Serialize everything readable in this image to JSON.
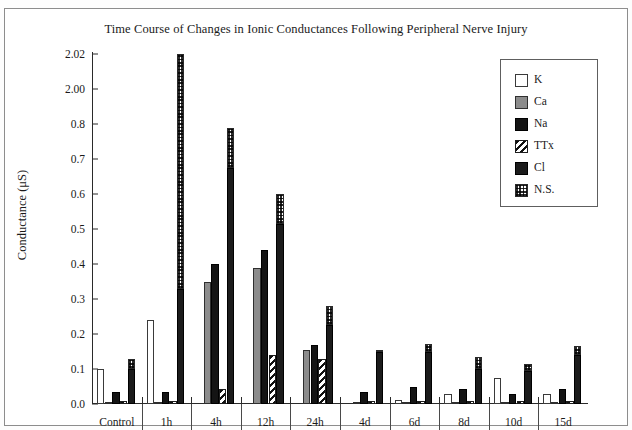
{
  "chart_data": {
    "type": "bar",
    "title": "Time Course of Changes in Ionic Conductances Following Peripheral Nerve Injury",
    "xlabel": "",
    "ylabel": "Conductance (μS)",
    "grid": false,
    "legend_position": "top-right",
    "broken_axis": true,
    "y_ticks": [
      {
        "label": "0.0",
        "value": 0.0
      },
      {
        "label": "0.1",
        "value": 0.1
      },
      {
        "label": "0.2",
        "value": 0.2
      },
      {
        "label": "0.3",
        "value": 0.3
      },
      {
        "label": "0.4",
        "value": 0.4
      },
      {
        "label": "0.5",
        "value": 0.5
      },
      {
        "label": "0.6",
        "value": 0.6
      },
      {
        "label": "0.7",
        "value": 0.7
      },
      {
        "label": "0.8",
        "value": 0.8
      },
      {
        "label": "2.00",
        "value": 2.0
      },
      {
        "label": "2.02",
        "value": 2.02
      }
    ],
    "ylim": [
      0.0,
      2.02
    ],
    "categories": [
      "Control",
      "1h",
      "4h",
      "12h",
      "24h",
      "4d",
      "6d",
      "8d",
      "10d",
      "15d"
    ],
    "series": [
      {
        "name": "K",
        "values": [
          0.1,
          0.24,
          0.0,
          0.0,
          0.0,
          0.0,
          0.012,
          0.03,
          0.075,
          0.03
        ]
      },
      {
        "name": "Ca",
        "values": [
          0.006,
          0.004,
          0.35,
          0.39,
          0.155,
          0.006,
          0.006,
          0.005,
          0.004,
          0.004
        ]
      },
      {
        "name": "Na",
        "values": [
          0.035,
          0.035,
          0.4,
          0.44,
          0.17,
          0.035,
          0.05,
          0.042,
          0.03,
          0.042
        ]
      },
      {
        "name": "TTx",
        "values": [
          0.01,
          0.008,
          0.042,
          0.14,
          0.13,
          0.008,
          0.01,
          0.008,
          0.01,
          0.01
        ]
      },
      {
        "name": "Cl",
        "values": [
          0.1,
          0.33,
          0.675,
          0.515,
          0.225,
          0.148,
          0.148,
          0.1,
          0.095,
          0.14
        ]
      },
      {
        "name": "N.S.",
        "values": [
          0.13,
          2.02,
          0.79,
          0.6,
          0.28,
          0.155,
          0.172,
          0.133,
          0.113,
          0.165
        ]
      }
    ],
    "stacked_note": "Cl and N.S. are drawn as one stacked bar: black Cl base with checkered N.S. top.",
    "legend": [
      {
        "label": "K",
        "pattern": "white-outline"
      },
      {
        "label": "Ca",
        "pattern": "solid-gray"
      },
      {
        "label": "Na",
        "pattern": "solid-black"
      },
      {
        "label": "TTx",
        "pattern": "diagonal-hatch"
      },
      {
        "label": "Cl",
        "pattern": "solid-dark"
      },
      {
        "label": "N.S.",
        "pattern": "checkerboard"
      }
    ]
  }
}
